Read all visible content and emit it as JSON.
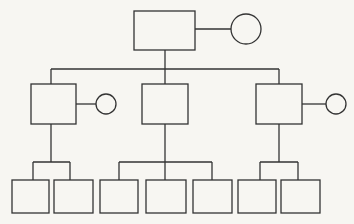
{
  "diagram": {
    "type": "pedigree-chart",
    "background": "#f7f6f2",
    "stroke_color": "#333333",
    "generations": [
      {
        "level": 1,
        "couples": [
          {
            "male": {
              "shape": "square",
              "x": 134,
              "y": 11,
              "w": 61,
              "h": 39
            },
            "female": {
              "shape": "circle",
              "cx": 246,
              "cy": 29,
              "r": 15
            }
          }
        ]
      },
      {
        "level": 2,
        "members": [
          {
            "shape": "square",
            "x": 31,
            "y": 84,
            "w": 45,
            "h": 40,
            "spouse": {
              "shape": "circle",
              "cx": 106,
              "cy": 104,
              "r": 10
            }
          },
          {
            "shape": "square",
            "x": 142,
            "y": 84,
            "w": 46,
            "h": 40
          },
          {
            "shape": "square",
            "x": 256,
            "y": 84,
            "w": 46,
            "h": 40,
            "spouse": {
              "shape": "circle",
              "cx": 336,
              "cy": 104,
              "r": 10
            }
          }
        ]
      },
      {
        "level": 3,
        "groups": [
          {
            "parent_index": 0,
            "children": 2
          },
          {
            "parent_index": 1,
            "children": 3
          },
          {
            "parent_index": 2,
            "children": 2
          }
        ],
        "members": [
          {
            "shape": "square",
            "x": 12,
            "y": 180,
            "w": 37,
            "h": 33
          },
          {
            "shape": "square",
            "x": 54,
            "y": 180,
            "w": 39,
            "h": 33
          },
          {
            "shape": "square",
            "x": 100,
            "y": 180,
            "w": 38,
            "h": 33
          },
          {
            "shape": "square",
            "x": 146,
            "y": 180,
            "w": 40,
            "h": 33
          },
          {
            "shape": "square",
            "x": 193,
            "y": 180,
            "w": 39,
            "h": 33
          },
          {
            "shape": "square",
            "x": 238,
            "y": 180,
            "w": 38,
            "h": 33
          },
          {
            "shape": "square",
            "x": 281,
            "y": 180,
            "w": 39,
            "h": 33
          }
        ]
      }
    ]
  }
}
